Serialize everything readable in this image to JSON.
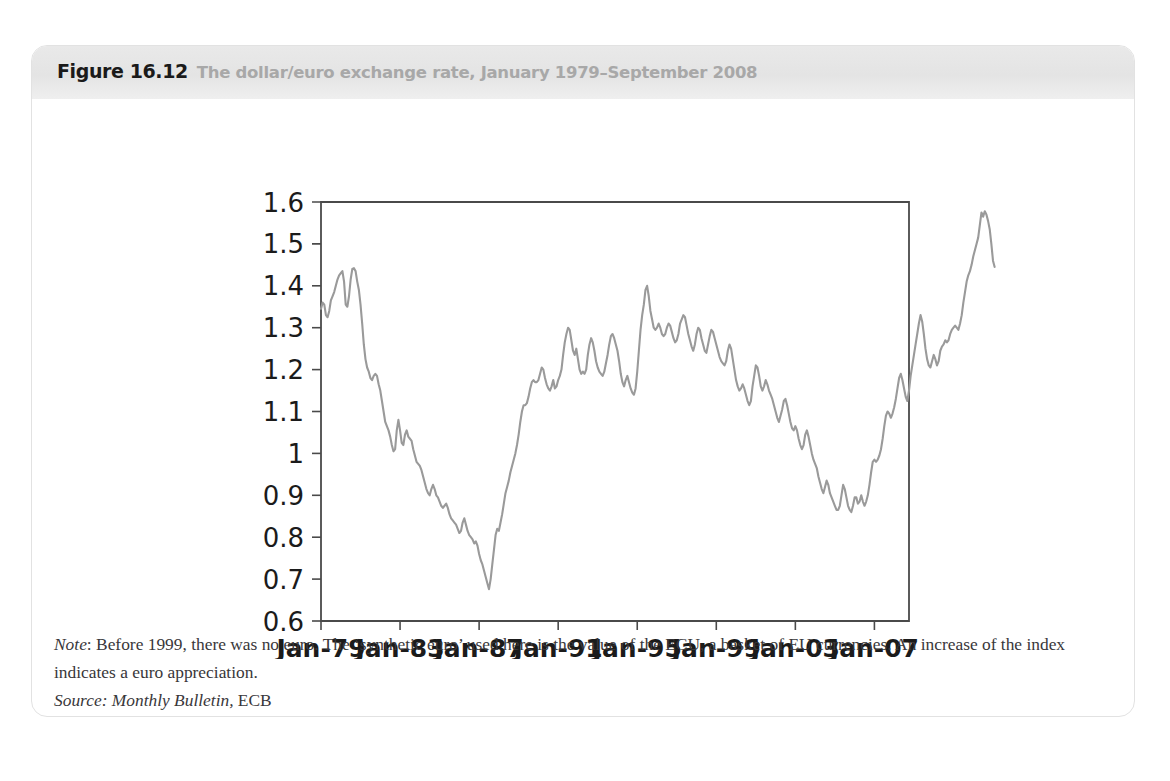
{
  "figure": {
    "label": "Figure 16.12",
    "title": "The dollar/euro exchange rate, January 1979–September 2008",
    "note_prefix": "Note",
    "note_text": ": Before 1999, there was no euro. The ‘synthetic euro’ used here is the value of the ECU, a basket of EU currencies. An increase of the index indicates a euro appreciation.",
    "source_prefix": "Source",
    "source_italic": ": Monthly Bulletin,",
    "source_rest": " ECB",
    "header_bg": "#e6e6e6",
    "label_color": "#1a1a1a",
    "title_color": "#a8a8a8",
    "border_color": "#e2e2e2"
  },
  "ghost": {
    "top": "",
    "right": "",
    "bottom": ""
  },
  "chart_data": {
    "type": "line",
    "title": "The dollar/euro exchange rate, January 1979–September 2008",
    "xlabel": "",
    "ylabel": "",
    "grid": false,
    "legend": "none",
    "line_color": "#9a9a9a",
    "axis_color": "#4a4a4a",
    "ylim": [
      0.6,
      1.6
    ],
    "yticks": [
      "0.6",
      "0.7",
      "0.8",
      "0.9",
      "1",
      "1.1",
      "1.2",
      "1.3",
      "1.4",
      "1.5",
      "1.6"
    ],
    "ytick_values": [
      0.6,
      0.7,
      0.8,
      0.9,
      1.0,
      1.1,
      1.2,
      1.3,
      1.4,
      1.5,
      1.6
    ],
    "xticks": [
      "Jan-79",
      "Jan-83",
      "Jan-87",
      "Jan-91",
      "Jan-95",
      "Jan-99",
      "Jan-03",
      "Jan-07"
    ],
    "xtick_values": [
      1979.0,
      1983.0,
      1987.0,
      1991.0,
      1995.0,
      1999.0,
      2003.0,
      2007.0
    ],
    "xlim": [
      1979.0,
      2008.75
    ],
    "x_start": 1979.0,
    "x_step_years": 0.08333333,
    "series": [
      {
        "name": "USD per EUR (synthetic euro before 1999)",
        "values": [
          1.345,
          1.36,
          1.355,
          1.33,
          1.325,
          1.34,
          1.365,
          1.375,
          1.385,
          1.4,
          1.415,
          1.425,
          1.43,
          1.435,
          1.41,
          1.355,
          1.35,
          1.375,
          1.415,
          1.44,
          1.442,
          1.435,
          1.41,
          1.39,
          1.355,
          1.31,
          1.26,
          1.225,
          1.205,
          1.195,
          1.18,
          1.175,
          1.185,
          1.19,
          1.185,
          1.165,
          1.15,
          1.125,
          1.1,
          1.075,
          1.065,
          1.055,
          1.04,
          1.02,
          1.005,
          1.01,
          1.055,
          1.08,
          1.055,
          1.025,
          1.02,
          1.045,
          1.055,
          1.04,
          1.035,
          1.03,
          1.01,
          0.995,
          0.98,
          0.975,
          0.97,
          0.96,
          0.945,
          0.93,
          0.915,
          0.905,
          0.9,
          0.915,
          0.925,
          0.915,
          0.9,
          0.895,
          0.885,
          0.875,
          0.87,
          0.875,
          0.88,
          0.87,
          0.855,
          0.845,
          0.84,
          0.835,
          0.83,
          0.82,
          0.81,
          0.815,
          0.835,
          0.845,
          0.83,
          0.815,
          0.805,
          0.8,
          0.795,
          0.785,
          0.79,
          0.78,
          0.76,
          0.745,
          0.735,
          0.72,
          0.705,
          0.69,
          0.676,
          0.7,
          0.735,
          0.77,
          0.805,
          0.82,
          0.815,
          0.835,
          0.855,
          0.88,
          0.905,
          0.92,
          0.935,
          0.955,
          0.97,
          0.985,
          1.0,
          1.02,
          1.045,
          1.075,
          1.1,
          1.115,
          1.115,
          1.12,
          1.135,
          1.155,
          1.17,
          1.175,
          1.17,
          1.17,
          1.175,
          1.19,
          1.205,
          1.2,
          1.18,
          1.165,
          1.155,
          1.15,
          1.16,
          1.175,
          1.155,
          1.16,
          1.175,
          1.185,
          1.2,
          1.235,
          1.265,
          1.285,
          1.3,
          1.295,
          1.27,
          1.245,
          1.235,
          1.25,
          1.225,
          1.2,
          1.19,
          1.195,
          1.19,
          1.2,
          1.235,
          1.26,
          1.275,
          1.265,
          1.245,
          1.22,
          1.205,
          1.195,
          1.19,
          1.185,
          1.195,
          1.215,
          1.235,
          1.26,
          1.28,
          1.285,
          1.275,
          1.26,
          1.245,
          1.22,
          1.19,
          1.17,
          1.16,
          1.175,
          1.185,
          1.17,
          1.155,
          1.145,
          1.14,
          1.155,
          1.195,
          1.245,
          1.295,
          1.33,
          1.355,
          1.39,
          1.4,
          1.375,
          1.34,
          1.32,
          1.3,
          1.295,
          1.3,
          1.31,
          1.3,
          1.285,
          1.28,
          1.285,
          1.3,
          1.31,
          1.305,
          1.29,
          1.275,
          1.265,
          1.27,
          1.285,
          1.31,
          1.32,
          1.33,
          1.325,
          1.305,
          1.285,
          1.27,
          1.255,
          1.245,
          1.26,
          1.285,
          1.3,
          1.295,
          1.275,
          1.26,
          1.245,
          1.24,
          1.26,
          1.28,
          1.295,
          1.29,
          1.275,
          1.26,
          1.245,
          1.23,
          1.22,
          1.215,
          1.21,
          1.22,
          1.245,
          1.26,
          1.25,
          1.225,
          1.2,
          1.175,
          1.16,
          1.15,
          1.155,
          1.165,
          1.155,
          1.14,
          1.125,
          1.115,
          1.125,
          1.16,
          1.185,
          1.21,
          1.205,
          1.185,
          1.16,
          1.15,
          1.16,
          1.175,
          1.165,
          1.15,
          1.14,
          1.13,
          1.115,
          1.1,
          1.085,
          1.075,
          1.09,
          1.105,
          1.125,
          1.13,
          1.115,
          1.095,
          1.075,
          1.06,
          1.055,
          1.065,
          1.055,
          1.035,
          1.02,
          1.01,
          1.02,
          1.045,
          1.055,
          1.04,
          1.02,
          1.0,
          0.985,
          0.975,
          0.965,
          0.945,
          0.93,
          0.915,
          0.905,
          0.92,
          0.935,
          0.925,
          0.905,
          0.895,
          0.885,
          0.875,
          0.865,
          0.865,
          0.875,
          0.9,
          0.925,
          0.915,
          0.895,
          0.875,
          0.865,
          0.86,
          0.875,
          0.895,
          0.895,
          0.88,
          0.885,
          0.9,
          0.885,
          0.875,
          0.885,
          0.9,
          0.925,
          0.955,
          0.98,
          0.985,
          0.98,
          0.985,
          0.995,
          1.01,
          1.035,
          1.065,
          1.09,
          1.1,
          1.095,
          1.085,
          1.095,
          1.11,
          1.13,
          1.155,
          1.18,
          1.19,
          1.175,
          1.155,
          1.135,
          1.125,
          1.15,
          1.185,
          1.21,
          1.235,
          1.26,
          1.285,
          1.31,
          1.33,
          1.315,
          1.285,
          1.25,
          1.225,
          1.21,
          1.205,
          1.22,
          1.235,
          1.225,
          1.21,
          1.22,
          1.245,
          1.255,
          1.26,
          1.27,
          1.265,
          1.27,
          1.285,
          1.295,
          1.3,
          1.305,
          1.3,
          1.295,
          1.31,
          1.33,
          1.36,
          1.385,
          1.41,
          1.425,
          1.435,
          1.45,
          1.47,
          1.485,
          1.5,
          1.515,
          1.545,
          1.575,
          1.565,
          1.578,
          1.57,
          1.555,
          1.535,
          1.5,
          1.46,
          1.445
        ]
      }
    ]
  }
}
